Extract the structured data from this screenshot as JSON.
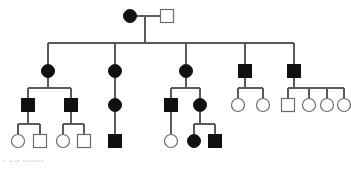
{
  "figure": {
    "caption_fragment": "Ped chart",
    "width": 351,
    "height": 176,
    "background_color": "#ffffff",
    "line_color": "#5a5a5a",
    "affected_color": "#111111",
    "unaffected_fill": "#ffffff",
    "unaffected_stroke": "#6b6b6b"
  },
  "legend_semantics": {
    "filled_circle": "affected female",
    "open_circle": "unaffected female",
    "filled_square": "affected male",
    "open_square": "unaffected male"
  },
  "pedigree": {
    "generation_count": 4,
    "generations": [
      {
        "id": "I",
        "y": 16,
        "individuals": [
          {
            "id": "I-1",
            "shape": "circle",
            "status": "affected",
            "sex": "female",
            "x": 130,
            "y": 16,
            "r": 6.5
          },
          {
            "id": "I-2",
            "shape": "square",
            "status": "unaffected",
            "sex": "male",
            "x": 167,
            "y": 16,
            "size": 13
          }
        ]
      },
      {
        "id": "II",
        "y": 71,
        "individuals": [
          {
            "id": "II-1",
            "shape": "circle",
            "status": "affected",
            "sex": "female",
            "x": 48,
            "y": 71,
            "r": 6.5
          },
          {
            "id": "II-2",
            "shape": "circle",
            "status": "affected",
            "sex": "female",
            "x": 115,
            "y": 71,
            "r": 6.5
          },
          {
            "id": "II-3",
            "shape": "circle",
            "status": "affected",
            "sex": "female",
            "x": 186,
            "y": 71,
            "r": 6.5
          },
          {
            "id": "II-4",
            "shape": "square",
            "status": "affected",
            "sex": "male",
            "x": 245,
            "y": 71,
            "size": 13
          },
          {
            "id": "II-5",
            "shape": "square",
            "status": "affected",
            "sex": "male",
            "x": 294,
            "y": 71,
            "size": 13
          }
        ]
      },
      {
        "id": "III",
        "y": 105,
        "individuals": [
          {
            "id": "III-1",
            "shape": "square",
            "status": "affected",
            "sex": "male",
            "x": 28,
            "y": 105,
            "size": 13
          },
          {
            "id": "III-2",
            "shape": "square",
            "status": "affected",
            "sex": "male",
            "x": 71,
            "y": 105,
            "size": 13
          },
          {
            "id": "III-3",
            "shape": "circle",
            "status": "affected",
            "sex": "female",
            "x": 115,
            "y": 105,
            "r": 6.5
          },
          {
            "id": "III-4",
            "shape": "square",
            "status": "affected",
            "sex": "male",
            "x": 171,
            "y": 105,
            "size": 13
          },
          {
            "id": "III-5",
            "shape": "circle",
            "status": "affected",
            "sex": "female",
            "x": 200,
            "y": 105,
            "r": 6.5
          },
          {
            "id": "III-6",
            "shape": "circle",
            "status": "unaffected",
            "sex": "female",
            "x": 238,
            "y": 105,
            "r": 6.5
          },
          {
            "id": "III-7",
            "shape": "circle",
            "status": "unaffected",
            "sex": "female",
            "x": 263,
            "y": 105,
            "r": 6.5
          },
          {
            "id": "III-8",
            "shape": "square",
            "status": "unaffected",
            "sex": "male",
            "x": 288,
            "y": 105,
            "size": 13
          },
          {
            "id": "III-9",
            "shape": "circle",
            "status": "unaffected",
            "sex": "female",
            "x": 309,
            "y": 105,
            "r": 6.5
          },
          {
            "id": "III-10",
            "shape": "circle",
            "status": "unaffected",
            "sex": "female",
            "x": 327,
            "y": 105,
            "r": 6.5
          },
          {
            "id": "III-11",
            "shape": "circle",
            "status": "unaffected",
            "sex": "female",
            "x": 344,
            "y": 105,
            "r": 6.5
          }
        ]
      },
      {
        "id": "IV",
        "y": 141,
        "individuals": [
          {
            "id": "IV-1",
            "shape": "circle",
            "status": "unaffected",
            "sex": "female",
            "x": 18,
            "y": 141,
            "r": 6.5
          },
          {
            "id": "IV-2",
            "shape": "square",
            "status": "unaffected",
            "sex": "male",
            "x": 40,
            "y": 141,
            "size": 13
          },
          {
            "id": "IV-3",
            "shape": "circle",
            "status": "unaffected",
            "sex": "female",
            "x": 63,
            "y": 141,
            "r": 6.5
          },
          {
            "id": "IV-4",
            "shape": "square",
            "status": "unaffected",
            "sex": "male",
            "x": 84,
            "y": 141,
            "size": 13
          },
          {
            "id": "IV-5",
            "shape": "square",
            "status": "affected",
            "sex": "male",
            "x": 115,
            "y": 141,
            "size": 13
          },
          {
            "id": "IV-6",
            "shape": "circle",
            "status": "unaffected",
            "sex": "female",
            "x": 171,
            "y": 141,
            "r": 6.5
          },
          {
            "id": "IV-7",
            "shape": "circle",
            "status": "affected",
            "sex": "female",
            "x": 194,
            "y": 141,
            "r": 6.5
          },
          {
            "id": "IV-8",
            "shape": "square",
            "status": "affected",
            "sex": "male",
            "x": 215,
            "y": 141,
            "size": 13
          }
        ]
      }
    ],
    "connections": {
      "mating_lines": [
        {
          "id": "mating-I",
          "x1": 137,
          "x2": 160,
          "y": 16
        }
      ],
      "descent_drops": [
        {
          "id": "drop-I",
          "x": 145,
          "y1": 16,
          "y2": 43
        }
      ],
      "sibship_bars": [
        {
          "id": "sibship-II",
          "x1": 48,
          "x2": 294,
          "y": 43
        },
        {
          "id": "sibship-III-a",
          "x1": 28,
          "x2": 71,
          "y": 88
        },
        {
          "id": "sibship-III-c",
          "x1": 171,
          "x2": 200,
          "y": 88
        },
        {
          "id": "sibship-III-d",
          "x1": 238,
          "x2": 263,
          "y": 88
        },
        {
          "id": "sibship-III-e",
          "x1": 288,
          "x2": 344,
          "y": 88
        },
        {
          "id": "sibship-IV-a",
          "x1": 18,
          "x2": 40,
          "y": 124
        },
        {
          "id": "sibship-IV-b",
          "x1": 63,
          "x2": 84,
          "y": 124
        },
        {
          "id": "sibship-IV-d",
          "x1": 194,
          "x2": 215,
          "y": 124
        }
      ],
      "vertical_links": [
        {
          "id": "v-II1",
          "x": 48,
          "y1": 43,
          "y2": 64
        },
        {
          "id": "v-II2",
          "x": 115,
          "y1": 43,
          "y2": 64
        },
        {
          "id": "v-II3",
          "x": 186,
          "y1": 43,
          "y2": 64
        },
        {
          "id": "v-II4",
          "x": 245,
          "y1": 43,
          "y2": 64
        },
        {
          "id": "v-II5",
          "x": 294,
          "y1": 43,
          "y2": 64
        },
        {
          "id": "v-II1-down",
          "x": 48,
          "y1": 78,
          "y2": 88
        },
        {
          "id": "v-III1-up",
          "x": 28,
          "y1": 88,
          "y2": 98
        },
        {
          "id": "v-III2-up",
          "x": 71,
          "y1": 88,
          "y2": 98
        },
        {
          "id": "v-II2-chain",
          "x": 115,
          "y1": 78,
          "y2": 98
        },
        {
          "id": "v-III3-chain",
          "x": 115,
          "y1": 112,
          "y2": 134
        },
        {
          "id": "v-II3-down",
          "x": 186,
          "y1": 78,
          "y2": 88
        },
        {
          "id": "v-III4-up",
          "x": 171,
          "y1": 88,
          "y2": 98
        },
        {
          "id": "v-III5-up",
          "x": 200,
          "y1": 88,
          "y2": 98
        },
        {
          "id": "v-II4-down",
          "x": 245,
          "y1": 78,
          "y2": 88
        },
        {
          "id": "v-III6-up",
          "x": 238,
          "y1": 88,
          "y2": 98
        },
        {
          "id": "v-III7-up",
          "x": 263,
          "y1": 88,
          "y2": 98
        },
        {
          "id": "v-II5-down",
          "x": 294,
          "y1": 78,
          "y2": 88
        },
        {
          "id": "v-III8-up",
          "x": 288,
          "y1": 88,
          "y2": 98
        },
        {
          "id": "v-III9-up",
          "x": 309,
          "y1": 88,
          "y2": 98
        },
        {
          "id": "v-III10-up",
          "x": 327,
          "y1": 88,
          "y2": 98
        },
        {
          "id": "v-III11-up",
          "x": 344,
          "y1": 88,
          "y2": 98
        },
        {
          "id": "v-III1-down",
          "x": 28,
          "y1": 112,
          "y2": 124
        },
        {
          "id": "v-IV1-up",
          "x": 18,
          "y1": 124,
          "y2": 134
        },
        {
          "id": "v-IV2-up",
          "x": 40,
          "y1": 124,
          "y2": 134
        },
        {
          "id": "v-III2-down",
          "x": 71,
          "y1": 112,
          "y2": 124
        },
        {
          "id": "v-IV3-up",
          "x": 63,
          "y1": 124,
          "y2": 134
        },
        {
          "id": "v-IV4-up",
          "x": 84,
          "y1": 124,
          "y2": 134
        },
        {
          "id": "v-III4-down",
          "x": 171,
          "y1": 112,
          "y2": 134
        },
        {
          "id": "v-III5-down",
          "x": 200,
          "y1": 112,
          "y2": 124
        },
        {
          "id": "v-IV7-up",
          "x": 194,
          "y1": 124,
          "y2": 134
        },
        {
          "id": "v-IV8-up",
          "x": 215,
          "y1": 124,
          "y2": 134
        }
      ]
    }
  }
}
